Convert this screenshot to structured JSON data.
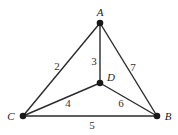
{
  "diagram": {
    "type": "weighted-graph",
    "vertices": [
      {
        "id": "A",
        "label": "A",
        "x": 100,
        "y": 23,
        "lx": 100,
        "ly": 16
      },
      {
        "id": "B",
        "label": "B",
        "x": 157,
        "y": 116,
        "lx": 168,
        "ly": 120
      },
      {
        "id": "C",
        "label": "C",
        "x": 23,
        "y": 116,
        "lx": 11,
        "ly": 120
      },
      {
        "id": "D",
        "label": "D",
        "x": 100,
        "y": 83,
        "lx": 111,
        "ly": 81
      }
    ],
    "edges": [
      {
        "from": "A",
        "to": "C",
        "weight": "2",
        "lx": 57,
        "ly": 70
      },
      {
        "from": "A",
        "to": "D",
        "weight": "3",
        "lx": 94,
        "ly": 65
      },
      {
        "from": "A",
        "to": "B",
        "weight": "7",
        "lx": 133,
        "ly": 71
      },
      {
        "from": "C",
        "to": "D",
        "weight": "4",
        "lx": 68,
        "ly": 107
      },
      {
        "from": "D",
        "to": "B",
        "weight": "6",
        "lx": 121,
        "ly": 107
      },
      {
        "from": "C",
        "to": "B",
        "weight": "5",
        "lx": 92,
        "ly": 129
      }
    ]
  }
}
